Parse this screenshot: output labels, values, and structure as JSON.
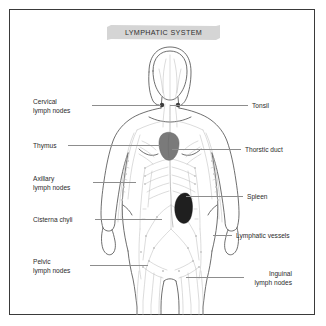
{
  "title": {
    "text": "LYMPHATIC SYSTEM",
    "banner_color": "#d5d5d5"
  },
  "frame": {
    "border_color": "#3a3a3a",
    "background": "#ffffff"
  },
  "colors": {
    "body_outline": "#555555",
    "vessel": "#b9b9b9",
    "node_marker": "#3d3d3d",
    "thymus": "#7a7a7a",
    "spleen": "#1f1f1f",
    "leader_line": "#8d8d8d",
    "label_text": "#2b2b2b"
  },
  "labels": {
    "left": [
      {
        "id": "cervical-lymph-nodes",
        "text": "Cervical\nlymph nodes"
      },
      {
        "id": "thymus",
        "text": "Thymus"
      },
      {
        "id": "axillary-lymph-nodes",
        "text": "Axillary\nlymph nodes"
      },
      {
        "id": "cisterna-chyli",
        "text": "Cisterna chyli"
      },
      {
        "id": "pelvic-lymph-nodes",
        "text": "Pelvic\nlymph nodes"
      }
    ],
    "right": [
      {
        "id": "tonsil",
        "text": "Tonsil"
      },
      {
        "id": "thoracic-duct",
        "text": "Thorstic duct"
      },
      {
        "id": "spleen",
        "text": "Spleen"
      },
      {
        "id": "lymphatic-vessels",
        "text": "Lymphatic vessels"
      },
      {
        "id": "inguinal-lymph-nodes",
        "text": "Inguinal\nlymph nodes"
      }
    ]
  }
}
